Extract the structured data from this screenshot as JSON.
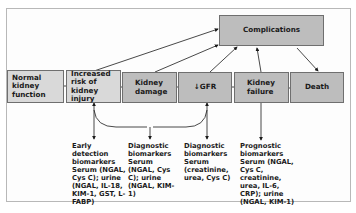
{
  "diagram": {
    "nodes": [
      {
        "id": "complications",
        "label": "Complications"
      },
      {
        "id": "normal",
        "label": "Normal kidney function"
      },
      {
        "id": "risk",
        "label": "Increased risk of kidney injury"
      },
      {
        "id": "damage",
        "label": "Kidney damage"
      },
      {
        "id": "gfr",
        "label": "↓GFR"
      },
      {
        "id": "failure",
        "label": "Kidney failure"
      },
      {
        "id": "death",
        "label": "Death"
      }
    ],
    "biomarkers": [
      {
        "title": "Early detection biomarkers",
        "text": "Serum (NGAL, Cys C); urine (NGAL, IL-18, KIM-1, GST, L-FABP)"
      },
      {
        "title": "Diagnostic biomarkers",
        "text": "Serum (NGAL, Cys C); urine (NGAL, KIM-1)"
      },
      {
        "title": "Diagnostic biomarkers",
        "text": "Serum (creatinine, urea, Cys C)"
      },
      {
        "title": "Prognostic biomarkers",
        "text": "Serum (NGAL, Cys C, creatinine, urea, IL-6, CRP); urine (NGAL, KIM-1)"
      }
    ],
    "colors": {
      "light_box": "#d9d9d9",
      "dark_box": "#bdbdbd",
      "border": "#6f6f6f",
      "arrow": "#1a1a1a"
    }
  }
}
